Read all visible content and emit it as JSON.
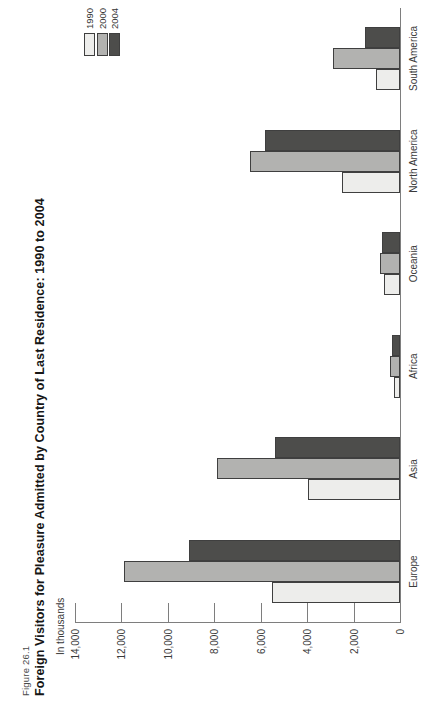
{
  "figure": {
    "label": "Figure 26.1",
    "title": "Foreign Visitors for Pleasure Admitted by Country of Last Residence: 1990 to 2004"
  },
  "chart_data": {
    "type": "bar",
    "title": "Foreign Visitors for Pleasure Admitted by Country of Last Residence: 1990 to 2004",
    "unit_label": "In thousands",
    "orientation_note": "landscape grouped column chart rotated 90 degrees counter-clockwise on a portrait page",
    "categories": [
      "Europe",
      "Asia",
      "Africa",
      "Oceania",
      "North America",
      "South America"
    ],
    "series": [
      {
        "name": "1990",
        "color": "#ededeb",
        "values": [
          5500,
          3950,
          240,
          700,
          2500,
          1050
        ]
      },
      {
        "name": "2000",
        "color": "#b2b2b0",
        "values": [
          11900,
          7900,
          450,
          880,
          6450,
          2900
        ]
      },
      {
        "name": "2004",
        "color": "#4d4d4b",
        "values": [
          9100,
          5400,
          350,
          770,
          5800,
          1500
        ]
      }
    ],
    "ylabel": "In thousands",
    "ylim": [
      0,
      14000
    ],
    "yticks": [
      {
        "value": 14000,
        "label": "14,000"
      },
      {
        "value": 12000,
        "label": "12,000"
      },
      {
        "value": 10000,
        "label": "10,000"
      },
      {
        "value": 8000,
        "label": "8,000"
      },
      {
        "value": 6000,
        "label": "6,000"
      },
      {
        "value": 4000,
        "label": "4,000"
      },
      {
        "value": 2000,
        "label": "2,000"
      },
      {
        "value": 0,
        "label": "0"
      }
    ],
    "grid": false,
    "legend_position": "top-right"
  },
  "colors": {
    "background": "#ffffff",
    "axis": "#7e7e7e",
    "bar_border": "#3f3f3f",
    "text": "#3a3a3a",
    "title_text": "#161616",
    "figure_label_text": "#4a4a4a"
  }
}
